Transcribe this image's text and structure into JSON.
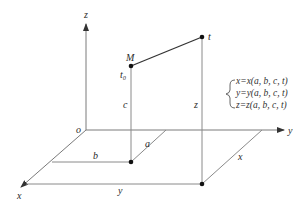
{
  "diagram": {
    "type": "3d-coordinate-trajectory",
    "axes": {
      "origin_label": "o",
      "x_label": "x",
      "y_label": "y",
      "z_label": "z"
    },
    "points": {
      "start_label": "M",
      "start_time_label": "t₀",
      "end_label": "t"
    },
    "dimension_labels": {
      "a": "a",
      "b": "b",
      "c": "c",
      "x": "x",
      "y": "y",
      "z": "z"
    },
    "equations": [
      "x=x(a, b, c, t)",
      "y=y(a, b, c, t)",
      "z=z(a, b, c, t)"
    ],
    "colors": {
      "lines": "#8a8a8a",
      "trajectory": "#333333",
      "points": "#111111"
    }
  }
}
